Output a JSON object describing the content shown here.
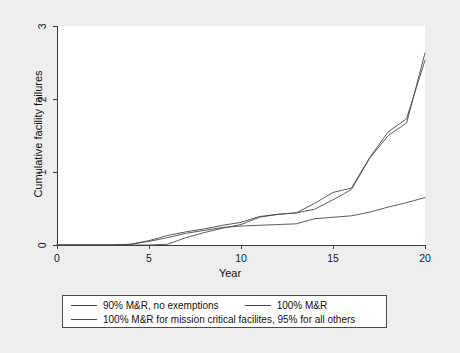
{
  "chart_data": {
    "type": "line",
    "title": "",
    "xlabel": "Year",
    "ylabel": "Cumulative facility failures",
    "xlim": [
      0,
      20
    ],
    "ylim": [
      0,
      3
    ],
    "xticks": [
      0,
      5,
      10,
      15,
      20
    ],
    "yticks": [
      0,
      1,
      2,
      3
    ],
    "xtick_labels": [
      "0",
      "5",
      "10",
      "15",
      "20"
    ],
    "ytick_labels": [
      "0",
      "1",
      "2",
      "3"
    ],
    "grid": false,
    "legend_position": "below-axes",
    "line_color": "#4a4a4a",
    "plot_background": "#ffffff",
    "figure_background": "#eeeeee",
    "x": [
      0,
      1,
      2,
      3,
      4,
      5,
      6,
      7,
      8,
      9,
      10,
      11,
      12,
      13,
      14,
      15,
      16,
      17,
      18,
      19,
      20
    ],
    "series": [
      {
        "name": "90% M&R, no exemptions",
        "values": [
          0,
          0,
          0,
          0,
          0.01,
          0.06,
          0.13,
          0.18,
          0.22,
          0.27,
          0.31,
          0.39,
          0.42,
          0.44,
          0.57,
          0.72,
          0.78,
          1.2,
          1.55,
          1.73,
          2.53
        ]
      },
      {
        "name": "100% M&R",
        "values": [
          0,
          0,
          0,
          0,
          0,
          0,
          0.01,
          0.1,
          0.17,
          0.23,
          0.28,
          0.38,
          0.42,
          0.44,
          0.49,
          0.62,
          0.76,
          1.19,
          1.5,
          1.67,
          2.63
        ]
      },
      {
        "name": "100% M&R for mission critical facilites, 95% for all others",
        "values": [
          0,
          0,
          0,
          0,
          0.01,
          0.05,
          0.1,
          0.16,
          0.2,
          0.24,
          0.26,
          0.27,
          0.28,
          0.29,
          0.36,
          0.38,
          0.4,
          0.45,
          0.52,
          0.58,
          0.65
        ]
      }
    ]
  },
  "legend": {
    "entries": [
      {
        "label": "90% M&R, no exemptions"
      },
      {
        "label": "100% M&R"
      },
      {
        "label": "100% M&R for mission critical facilites, 95% for all others"
      }
    ]
  }
}
